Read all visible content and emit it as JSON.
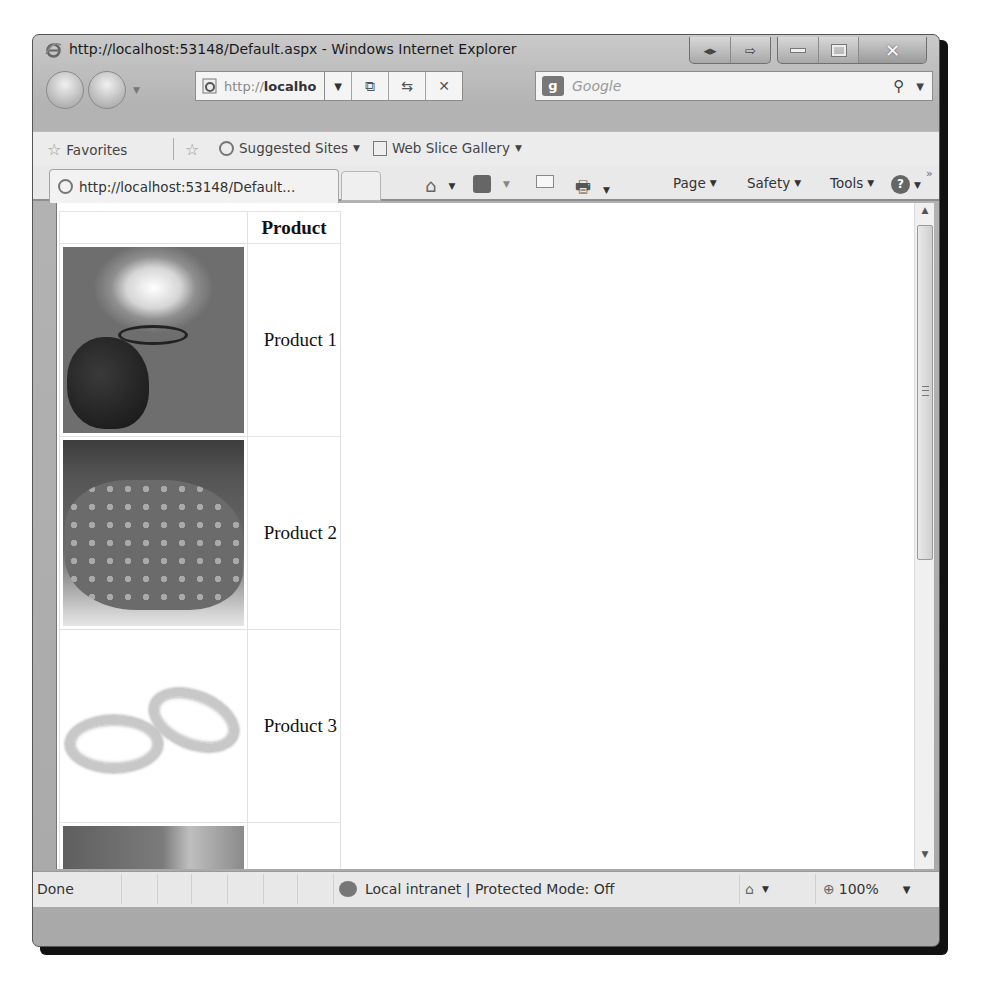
{
  "window": {
    "title": "http://localhost:53148/Default.aspx - Windows Internet Explorer",
    "caption_buttons": [
      "compatibility-view",
      "restore-tab",
      "minimize",
      "maximize",
      "close"
    ]
  },
  "navbar": {
    "address_host": "http://",
    "address_bold": "localhost",
    "address_rest": ":531",
    "tools": [
      "compatibility-view-icon",
      "refresh-icon",
      "stop-icon"
    ],
    "search_placeholder": "Google",
    "search_provider_icon": "google-icon"
  },
  "favorites_bar": {
    "favorites_label": "Favorites",
    "items": [
      {
        "label": "Suggested Sites",
        "icon": "ie-icon",
        "has_dropdown": true
      },
      {
        "label": "Web Slice Gallery",
        "icon": "web-slice-icon",
        "has_dropdown": true
      }
    ]
  },
  "tab": {
    "label": "http://localhost:53148/Default..."
  },
  "command_bar": {
    "icons": [
      "home-icon",
      "feeds-icon",
      "read-mail-icon",
      "print-icon"
    ],
    "menus": [
      {
        "label": "Page",
        "accel": "P"
      },
      {
        "label": "Safety",
        "accel": "S"
      },
      {
        "label": "Tools",
        "accel": "o"
      }
    ],
    "help_icon": "help-icon",
    "overflow": "»"
  },
  "content": {
    "table": {
      "header": [
        "",
        "Product"
      ],
      "rows": [
        {
          "image": "lamp",
          "name": "Product 1"
        },
        {
          "image": "stone",
          "name": "Product 2"
        },
        {
          "image": "rings",
          "name": "Product 3"
        },
        {
          "image": "partial",
          "name": ""
        }
      ]
    }
  },
  "statusbar": {
    "status": "Done",
    "zone": "Local intranet | Protected Mode: Off",
    "zoom": "100%"
  }
}
